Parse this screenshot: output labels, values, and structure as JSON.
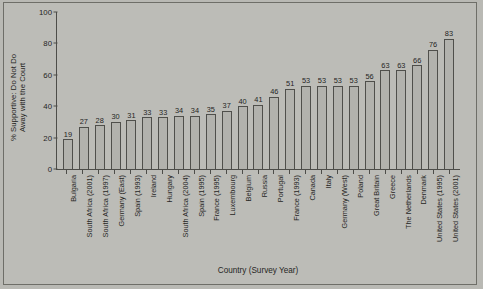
{
  "chart_data": {
    "type": "bar",
    "title": "",
    "xlabel": "Country (Survey Year)",
    "ylabel": "% Supportive: Do Not Do\nAway with the Court",
    "ylim": [
      0,
      100
    ],
    "yticks": [
      0,
      20,
      40,
      60,
      80,
      100
    ],
    "grid": false,
    "legend": false,
    "categories": [
      "Bulgaria",
      "South Africa (2001)",
      "South Africa (1997)",
      "Germany (East)",
      "Spain (1993)",
      "Ireland",
      "Hungary",
      "South Africa (2004)",
      "Spain (1995)",
      "France (1995)",
      "Luxembourg",
      "Belgium",
      "Russia",
      "Portugal",
      "France (1993)",
      "Canada",
      "Italy",
      "Germany (West)",
      "Poland",
      "Great Britain",
      "Greece",
      "The Netherlands",
      "Denmark",
      "United States (1995)",
      "United States (2001)"
    ],
    "values": [
      19,
      27,
      28,
      30,
      31,
      33,
      33,
      34,
      34,
      35,
      37,
      40,
      41,
      46,
      51,
      53,
      53,
      53,
      53,
      56,
      63,
      63,
      66,
      76,
      83
    ]
  },
  "colors": {
    "figure_background": "#b9b9b4",
    "plot_background": "#bcbcb7",
    "bar_fill": "#b2b2ad",
    "bar_border": "#4f4f4b",
    "axis": "#4d4d49",
    "text": "#262624"
  }
}
